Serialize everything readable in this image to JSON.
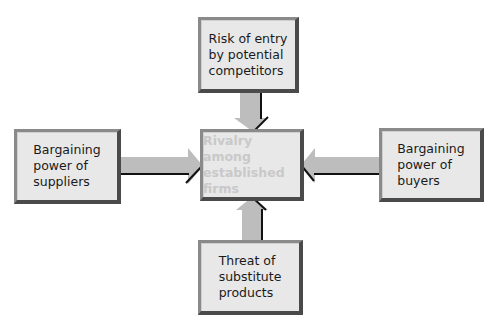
{
  "diagram": {
    "center": {
      "label": "Rivalry among\nestablished\nfirms"
    },
    "forces": [
      {
        "id": "top",
        "label": "Risk of entry\nby potential\ncompetitors"
      },
      {
        "id": "left",
        "label": "Bargaining\npower of\nsuppliers"
      },
      {
        "id": "right",
        "label": "Bargaining\npower of\nbuyers"
      },
      {
        "id": "bottom",
        "label": "Threat of\nsubstitute\nproducts"
      }
    ],
    "colors": {
      "box_fill": "#e8e8e8",
      "box_border_dark": "#4a4a4a",
      "box_border_light": "#8a8a8a",
      "arrow_fill": "#bdbdbd",
      "arrow_shadow": "#111111",
      "center_text": "#c9c9c9",
      "text": "#1a1a1a"
    }
  }
}
